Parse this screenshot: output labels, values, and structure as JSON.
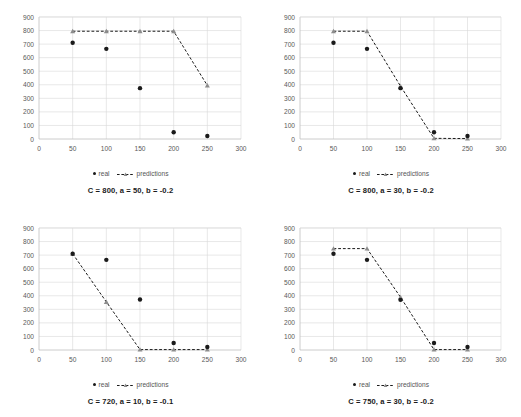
{
  "figure": {
    "background": "#ffffff",
    "caption": ""
  },
  "legend": {
    "real_label": "real",
    "predictions_label": "predictions",
    "real_color": "#1a1a1a",
    "predictions_color": "#1a1a1a",
    "marker_color": "#8c8c8c"
  },
  "axes": {
    "x_ticks": [
      "0",
      "50",
      "100",
      "150",
      "200",
      "250",
      "300"
    ],
    "y_ticks": [
      "0",
      "100",
      "200",
      "300",
      "400",
      "500",
      "600",
      "700",
      "800",
      "900"
    ],
    "xlim": [
      0,
      300
    ],
    "ylim": [
      0,
      900
    ],
    "grid": true,
    "grid_color": "#d9d9d9",
    "axis_color": "#bfbfbf",
    "tick_label_color": "#595959"
  },
  "chart_data": [
    {
      "type": "scatter",
      "panel": "top-left",
      "title": "C = 800, a = 50, b = -0.2",
      "xlabel": "",
      "ylabel": "",
      "xlim": [
        0,
        300
      ],
      "ylim": [
        0,
        900
      ],
      "x": [
        50,
        100,
        150,
        200,
        250
      ],
      "series": [
        {
          "name": "real",
          "values": [
            710,
            665,
            375,
            50,
            22
          ]
        },
        {
          "name": "predictions",
          "values": [
            795,
            795,
            795,
            795,
            395
          ]
        }
      ]
    },
    {
      "type": "scatter",
      "panel": "top-right",
      "title": "C = 800, a = 30, b = -0.2",
      "xlabel": "",
      "ylabel": "",
      "xlim": [
        0,
        300
      ],
      "ylim": [
        0,
        900
      ],
      "x": [
        50,
        100,
        150,
        200,
        250
      ],
      "series": [
        {
          "name": "real",
          "values": [
            710,
            665,
            375,
            50,
            22
          ]
        },
        {
          "name": "predictions",
          "values": [
            795,
            795,
            390,
            5,
            3
          ]
        }
      ]
    },
    {
      "type": "scatter",
      "panel": "bottom-left",
      "title": "C = 720, a = 10, b = -0.1",
      "xlabel": "",
      "ylabel": "",
      "xlim": [
        0,
        300
      ],
      "ylim": [
        0,
        900
      ],
      "x": [
        50,
        100,
        150,
        200,
        250
      ],
      "series": [
        {
          "name": "real",
          "values": [
            710,
            665,
            372,
            52,
            22
          ]
        },
        {
          "name": "predictions",
          "values": [
            710,
            355,
            3,
            3,
            3
          ]
        }
      ]
    },
    {
      "type": "scatter",
      "panel": "bottom-right",
      "title": "C = 750, a = 30, b = -0.2",
      "xlabel": "",
      "ylabel": "",
      "xlim": [
        0,
        300
      ],
      "ylim": [
        0,
        900
      ],
      "x": [
        50,
        100,
        150,
        200,
        250
      ],
      "series": [
        {
          "name": "real",
          "values": [
            710,
            665,
            370,
            52,
            22
          ]
        },
        {
          "name": "predictions",
          "values": [
            748,
            748,
            390,
            3,
            3
          ]
        }
      ]
    }
  ]
}
